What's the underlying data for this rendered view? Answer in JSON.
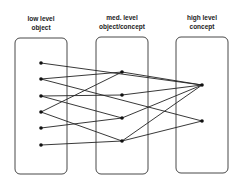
{
  "columns": [
    {
      "line1": "low level",
      "line2": "object"
    },
    {
      "line1": "med. level",
      "line2": "object/concept"
    },
    {
      "line1": "high level",
      "line2": "concept"
    }
  ],
  "boxes": [
    {
      "x": 15,
      "y": 38,
      "w": 52,
      "h": 136
    },
    {
      "x": 96,
      "y": 37,
      "w": 52,
      "h": 137
    },
    {
      "x": 176,
      "y": 37,
      "w": 52,
      "h": 136
    }
  ],
  "nodes": {
    "L1": [
      41,
      63
    ],
    "L2": [
      41,
      79
    ],
    "L3": [
      41,
      96
    ],
    "L4": [
      41,
      112
    ],
    "L5": [
      41,
      128
    ],
    "L6": [
      41,
      145
    ],
    "M1": [
      122,
      72
    ],
    "M2": [
      122,
      95
    ],
    "M3": [
      122,
      118
    ],
    "M4": [
      122,
      141
    ],
    "R1": [
      202,
      85
    ],
    "R2": [
      202,
      121
    ]
  },
  "edges": [
    [
      "L1",
      "R1"
    ],
    [
      "L2",
      "M1"
    ],
    [
      "L2",
      "R2"
    ],
    [
      "L3",
      "M2"
    ],
    [
      "L3",
      "M3"
    ],
    [
      "L4",
      "M1"
    ],
    [
      "L4",
      "M4"
    ],
    [
      "L5",
      "M3"
    ],
    [
      "L6",
      "M4"
    ],
    [
      "M1",
      "R1"
    ],
    [
      "M2",
      "R1"
    ],
    [
      "M3",
      "R1"
    ],
    [
      "M4",
      "R1"
    ],
    [
      "M4",
      "R2"
    ]
  ]
}
